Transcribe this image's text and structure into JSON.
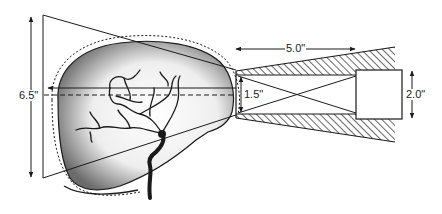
{
  "diagram": {
    "colors": {
      "ink": "#1a1a1a",
      "background": "#ffffff",
      "shading": "#6b6b6b"
    },
    "dimensions": {
      "field_height": "6.5\"",
      "collimator_length": "5.0\"",
      "aperture_height": "1.5\"",
      "detector_height": "2.0\""
    },
    "elements": [
      "field-of-view-frustum",
      "skull-outline",
      "cerebral-arteries",
      "carotid-artery",
      "central-ray-solid",
      "central-ray-dashed",
      "hatched-collimator",
      "collimator-crossed-lines",
      "detector-box"
    ]
  }
}
